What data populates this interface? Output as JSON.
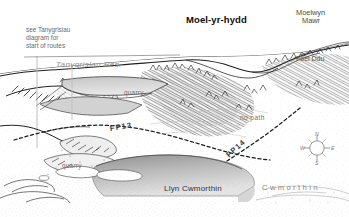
{
  "figure": {
    "name": "moel-yr-hydd-panorama-sketch",
    "title": "Moel-yr-hydd",
    "style": "pen-and-ink hand-drawn panoramic landscape sketch map",
    "width_px": 349,
    "height_px": 217,
    "background_color": "#ffffff",
    "ink_color": "#2b2b2b"
  },
  "labels": {
    "title": "Moel-yr-hydd",
    "peak_moelwyn_mawr_line1": "Moelwyn",
    "peak_moelwyn_mawr_line2": "Mawr",
    "peak_foel_ddu": "Foel Ddu",
    "reservoir": "Tanygrisiau Res.",
    "lake": "Llyn Cwmorthin",
    "valley": "Cwmorthin",
    "note_line1": "see Tanygrisiau",
    "note_line2": "diagram for",
    "note_line3": "start of routes",
    "quarry_upper": "quarry",
    "quarry_lower": "quarry",
    "no_path": "no path",
    "footpath_13": "FP13",
    "footpath_14": "FP14"
  },
  "compass": {
    "name": "compass-rose",
    "north": "N",
    "east": "E",
    "south": "S",
    "west": "W"
  },
  "colors": {
    "ink": "#2b2b2b",
    "water_fill_dark": "#9a9a9a",
    "water_fill_light": "#d8d8d8",
    "reservoir_fill": "#c9c9c9",
    "faint_grey": "#b4b4b4",
    "leader_line": "#b0b0b0"
  },
  "map_features": {
    "paths": [
      {
        "id": "FP13",
        "label": "FP13",
        "style": "dashed",
        "description": "footpath crossing mid-slope below the quarry workings"
      },
      {
        "id": "FP14",
        "label": "FP14",
        "style": "dashed",
        "description": "footpath descending diagonally into Cwmorthin valley"
      }
    ],
    "waters": [
      {
        "id": "tanygrisiau-reservoir",
        "label": "Tanygrisiau Res."
      },
      {
        "id": "llyn-cwmorthin",
        "label": "Llyn Cwmorthin"
      }
    ],
    "summits": [
      {
        "id": "moel-yr-hydd",
        "label": "Moel-yr-hydd"
      },
      {
        "id": "moelwyn-mawr",
        "label": "Moelwyn Mawr"
      },
      {
        "id": "foel-ddu",
        "label": "Foel Ddu"
      }
    ],
    "annotations": [
      {
        "id": "no-path",
        "label": "no path"
      },
      {
        "id": "quarry-upper",
        "label": "quarry"
      },
      {
        "id": "quarry-lower",
        "label": "quarry"
      }
    ]
  }
}
